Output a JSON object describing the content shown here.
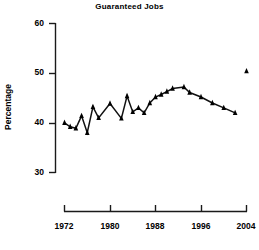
{
  "chart_data": {
    "type": "line",
    "title": "Guaranteed Jobs",
    "xlabel": "",
    "ylabel": "Percentage",
    "xlim": [
      1970,
      2005
    ],
    "ylim": [
      30,
      60
    ],
    "grid": false,
    "legend": null,
    "marker": "triangle",
    "xticks": [
      "1972",
      "1980",
      "1988",
      "1996",
      "2004"
    ],
    "xtick_values": [
      1972,
      1980,
      1988,
      1996,
      2004
    ],
    "yticks": [
      "30",
      "40",
      "50",
      "60"
    ],
    "ytick_values": [
      30,
      40,
      50,
      60
    ],
    "series": [
      {
        "name": "Guaranteed Jobs",
        "connected": true,
        "x": [
          1972,
          1973,
          1974,
          1975,
          1976,
          1977,
          1978,
          1980,
          1982,
          1983,
          1984,
          1985,
          1986,
          1987,
          1988,
          1989,
          1990,
          1991,
          1993,
          1994,
          1996,
          1998,
          2000,
          2002
        ],
        "values": [
          40.0,
          39.2,
          38.9,
          41.4,
          38.0,
          43.2,
          41.0,
          43.9,
          40.9,
          45.4,
          42.2,
          43.0,
          42.0,
          44.0,
          45.2,
          45.7,
          46.3,
          46.9,
          47.2,
          46.1,
          45.2,
          44.0,
          43.0,
          42.0
        ]
      },
      {
        "name": "2004 point",
        "connected": false,
        "x": [
          2004
        ],
        "values": [
          50.4
        ]
      }
    ]
  },
  "colors": {
    "axis": "#1a1a1a",
    "line": "#111111",
    "marker": "#000000",
    "background": "#ffffff"
  }
}
